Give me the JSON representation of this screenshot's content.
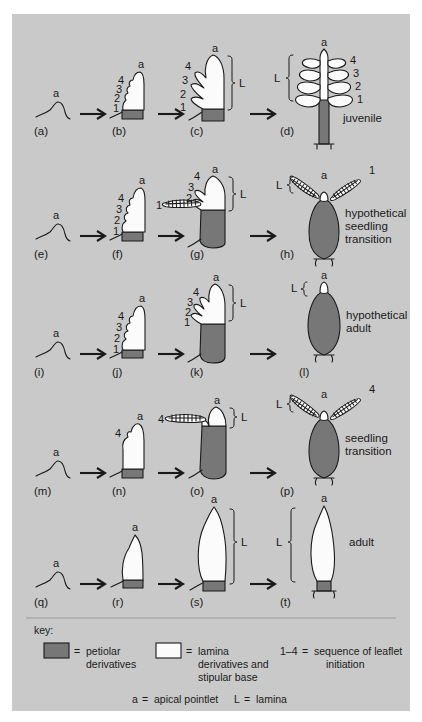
{
  "figure": {
    "background_color": "#c9c9c9",
    "petiolar_color": "#777777",
    "lamina_color": "#fbfbfb",
    "outline_color": "#1a1a1a"
  },
  "apical_label": "a",
  "lamina_label": "L",
  "leaflet_numbers": [
    "1",
    "2",
    "3",
    "4"
  ],
  "rows": [
    {
      "row_id": "row-juvenile",
      "outcome": "juvenile",
      "stages": [
        {
          "id": "(a)",
          "numbers": [],
          "apical": "a"
        },
        {
          "id": "(b)",
          "numbers": [
            "1",
            "2",
            "3",
            "4"
          ],
          "apical": "a"
        },
        {
          "id": "(c)",
          "numbers": [
            "1",
            "2",
            "3",
            "4"
          ],
          "apical": "a",
          "lamina": "L"
        },
        {
          "id": "(d)",
          "numbers": [
            "1",
            "2",
            "3",
            "4"
          ],
          "apical": "a",
          "lamina": "L"
        }
      ]
    },
    {
      "row_id": "row-hypothetical-seedling-transition",
      "outcome": "hypothetical\nseedling\ntransition",
      "outcome_lines": [
        "hypothetical",
        "seedling",
        "transition"
      ],
      "stages": [
        {
          "id": "(e)",
          "numbers": [],
          "apical": "a"
        },
        {
          "id": "(f)",
          "numbers": [
            "1",
            "2",
            "3",
            "4"
          ],
          "apical": "a"
        },
        {
          "id": "(g)",
          "numbers": [
            "1",
            "2",
            "3",
            "4"
          ],
          "apical": "a",
          "lamina": "L"
        },
        {
          "id": "(h)",
          "numbers": [
            "1"
          ],
          "apical": "a",
          "lamina": "L"
        }
      ]
    },
    {
      "row_id": "row-hypothetical-adult",
      "outcome": "hypothetical\nadult",
      "outcome_lines": [
        "hypothetical",
        "adult"
      ],
      "stages": [
        {
          "id": "(i)",
          "numbers": [],
          "apical": "a"
        },
        {
          "id": "(j)",
          "numbers": [
            "1",
            "2",
            "3",
            "4"
          ],
          "apical": "a"
        },
        {
          "id": "(k)",
          "numbers": [
            "1",
            "2",
            "3",
            "4"
          ],
          "apical": "a",
          "lamina": "L"
        },
        {
          "id": "(l)",
          "numbers": [],
          "apical": "a",
          "lamina": "L"
        }
      ]
    },
    {
      "row_id": "row-seedling-transition",
      "outcome": "seedling\ntransition",
      "outcome_lines": [
        "seedling",
        "transition"
      ],
      "stages": [
        {
          "id": "(m)",
          "numbers": [],
          "apical": "a"
        },
        {
          "id": "(n)",
          "numbers": [
            "4"
          ],
          "apical": "a"
        },
        {
          "id": "(o)",
          "numbers": [
            "4"
          ],
          "apical": "a",
          "lamina": "L"
        },
        {
          "id": "(p)",
          "numbers": [
            "4"
          ],
          "apical": "a",
          "lamina": "L"
        }
      ]
    },
    {
      "row_id": "row-adult",
      "outcome": "adult",
      "outcome_lines": [
        "adult"
      ],
      "stages": [
        {
          "id": "(q)",
          "numbers": [],
          "apical": "a"
        },
        {
          "id": "(r)",
          "numbers": [],
          "apical": "a"
        },
        {
          "id": "(s)",
          "numbers": [],
          "apical": "a",
          "lamina": "L"
        },
        {
          "id": "(t)",
          "numbers": [],
          "apical": "a",
          "lamina": "L"
        }
      ]
    }
  ],
  "key": {
    "heading": "key:",
    "entries": [
      {
        "swatch": "petiolar",
        "eq": "=",
        "lines": [
          "petiolar",
          "derivatives"
        ]
      },
      {
        "swatch": "lamina",
        "eq": "=",
        "lines": [
          "lamina",
          "derivatives and",
          "stipular base"
        ]
      },
      {
        "swatch": "none",
        "range": "1–4",
        "eq": "=",
        "lines": [
          "sequence of leaflet",
          "initiation"
        ]
      }
    ],
    "footnotes": [
      {
        "symbol": "a",
        "eq": "=",
        "text": "apical pointlet"
      },
      {
        "symbol": "L",
        "eq": "=",
        "text": "lamina"
      }
    ]
  }
}
